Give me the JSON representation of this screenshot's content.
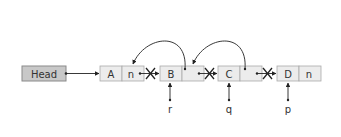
{
  "diagram": {
    "type": "linked-list-reversal",
    "colors": {
      "head_fill": "#c8c8c8",
      "node_fill": "#ececec",
      "stroke": "#9a9a9a",
      "arrow": "#222222",
      "text": "#333333"
    },
    "head": {
      "label": "Head"
    },
    "nodes": [
      {
        "id": "A",
        "data": "A",
        "next": "n"
      },
      {
        "id": "B",
        "data": "B",
        "next": ""
      },
      {
        "id": "C",
        "data": "C",
        "next": ""
      },
      {
        "id": "D",
        "data": "D",
        "next": "n"
      }
    ],
    "pointers": [
      {
        "name": "r",
        "target": "B"
      },
      {
        "name": "q",
        "target": "C"
      },
      {
        "name": "p",
        "target": "D"
      }
    ],
    "reversed_links": [
      {
        "from": "B",
        "to": "A"
      },
      {
        "from": "C",
        "to": "B"
      }
    ],
    "broken_links": [
      {
        "from": "A",
        "to": "B"
      },
      {
        "from": "B",
        "to": "C"
      },
      {
        "from": "C",
        "to": "D"
      }
    ]
  }
}
